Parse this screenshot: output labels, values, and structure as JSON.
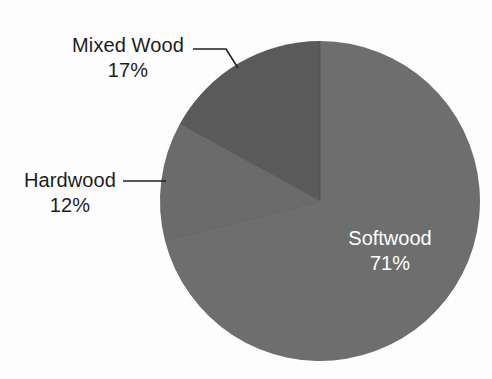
{
  "chart_data": {
    "type": "pie",
    "title": "",
    "subtitle": "",
    "xlabel": "",
    "ylabel": "",
    "legend_position": "none",
    "grid": false,
    "units": "percent",
    "categories": [
      "Softwood",
      "Mixed Wood",
      "Hardwood"
    ],
    "values": [
      71,
      17,
      12
    ],
    "labels_inside": [
      "Softwood"
    ],
    "labels_outside": [
      "Mixed Wood",
      "Hardwood"
    ],
    "slices": [
      {
        "name": "Softwood",
        "value": 71,
        "value_label": "71%",
        "color": "#6e6e6e",
        "start_angle_deg": 0,
        "end_angle_deg": 255.6,
        "label_placement": "inside",
        "label_color": "#ffffff"
      },
      {
        "name": "Hardwood",
        "value": 12,
        "value_label": "12%",
        "color": "#6b6b6b",
        "start_angle_deg": 255.6,
        "end_angle_deg": 298.8,
        "label_placement": "outside-left",
        "label_color": "#1d1d1d"
      },
      {
        "name": "Mixed Wood",
        "value": 17,
        "value_label": "17%",
        "color": "#5a5a5a",
        "start_angle_deg": 298.8,
        "end_angle_deg": 360,
        "label_placement": "outside-upper-left",
        "label_color": "#1d1d1d"
      }
    ]
  },
  "labels": {
    "mixed_wood": {
      "category": "Mixed Wood",
      "percent": "17%"
    },
    "hardwood": {
      "category": "Hardwood",
      "percent": "12%"
    },
    "softwood": {
      "category": "Softwood",
      "percent": "71%"
    }
  },
  "colors": {
    "background": "#fdfdfd",
    "softwood": "#6e6e6e",
    "hardwood": "#6b6b6b",
    "mixed_wood": "#5a5a5a",
    "leader_line": "#202020",
    "label_text": "#1d1d1d",
    "inside_label_text": "#ffffff"
  }
}
